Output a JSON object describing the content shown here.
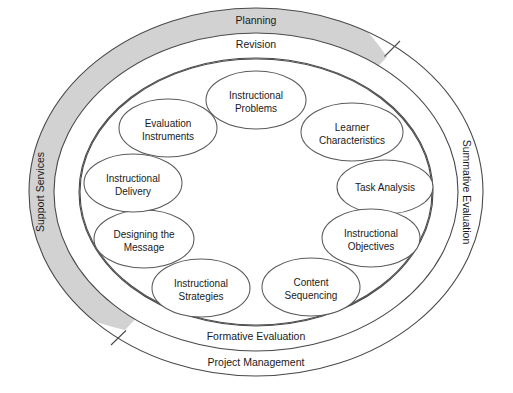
{
  "diagram": {
    "colors": {
      "gray_band": "#d2d2d2",
      "stroke": "#4a4a4a",
      "node_stroke": "#5a5a5a",
      "background": "#ffffff",
      "text": "#1a1a1a"
    },
    "outer_ring": {
      "name": "outer-ring",
      "labels": {
        "top": "Planning",
        "left": "Support Services",
        "bottom": "Project Management"
      }
    },
    "middle_ring": {
      "name": "middle-ring",
      "labels": {
        "top": "Revision",
        "right": "Summative Evaluation",
        "bottom": "Formative Evaluation"
      }
    },
    "core_elements": [
      {
        "id": "instructional-problems",
        "line1": "Instructional",
        "line2": "Problems",
        "cx": 256,
        "cy": 100,
        "rx": 50,
        "ry": 29
      },
      {
        "id": "learner-characteristics",
        "line1": "Learner",
        "line2": "Characteristics",
        "cx": 352,
        "cy": 132,
        "rx": 51,
        "ry": 29
      },
      {
        "id": "task-analysis",
        "line1": "Task Analysis",
        "line2": "",
        "cx": 385,
        "cy": 187,
        "rx": 48,
        "ry": 27
      },
      {
        "id": "instructional-objectives",
        "line1": "Instructional",
        "line2": "Objectives",
        "cx": 371,
        "cy": 238,
        "rx": 49,
        "ry": 29
      },
      {
        "id": "content-sequencing",
        "line1": "Content",
        "line2": "Sequencing",
        "cx": 311,
        "cy": 287,
        "rx": 49,
        "ry": 29
      },
      {
        "id": "instructional-strategies",
        "line1": "Instructional",
        "line2": "Strategies",
        "cx": 201,
        "cy": 288,
        "rx": 49,
        "ry": 29
      },
      {
        "id": "designing-the-message",
        "line1": "Designing the",
        "line2": "Message",
        "cx": 144,
        "cy": 239,
        "rx": 50,
        "ry": 29
      },
      {
        "id": "instructional-delivery",
        "line1": "Instructional",
        "line2": "Delivery",
        "cx": 133,
        "cy": 183,
        "rx": 49,
        "ry": 29
      },
      {
        "id": "evaluation-instruments",
        "line1": "Evaluation",
        "line2": "Instruments",
        "cx": 168,
        "cy": 128,
        "rx": 49,
        "ry": 29
      }
    ]
  }
}
